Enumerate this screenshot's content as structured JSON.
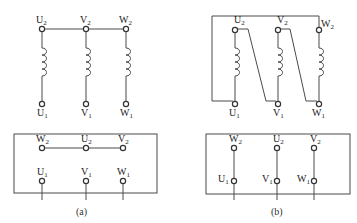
{
  "figure": {
    "panels": [
      {
        "id": "a",
        "caption": "(a)",
        "connection": "star",
        "windings": [
          {
            "top": {
              "base": "U",
              "sub": "2"
            },
            "bottom": {
              "base": "U",
              "sub": "1"
            }
          },
          {
            "top": {
              "base": "V",
              "sub": "2"
            },
            "bottom": {
              "base": "V",
              "sub": "1"
            }
          },
          {
            "top": {
              "base": "W",
              "sub": "2"
            },
            "bottom": {
              "base": "W",
              "sub": "1"
            }
          }
        ],
        "terminal_box": {
          "top_row": [
            {
              "base": "W",
              "sub": "2"
            },
            {
              "base": "U",
              "sub": "2"
            },
            {
              "base": "V",
              "sub": "2"
            }
          ],
          "bottom_row": [
            {
              "base": "U",
              "sub": "1"
            },
            {
              "base": "V",
              "sub": "1"
            },
            {
              "base": "W",
              "sub": "1"
            }
          ]
        }
      },
      {
        "id": "b",
        "caption": "(b)",
        "connection": "delta",
        "windings": [
          {
            "top": {
              "base": "U",
              "sub": "2"
            },
            "bottom": {
              "base": "U",
              "sub": "1"
            }
          },
          {
            "top": {
              "base": "V",
              "sub": "2"
            },
            "bottom": {
              "base": "V",
              "sub": "1"
            }
          },
          {
            "top": {
              "base": "W",
              "sub": "2"
            },
            "bottom": {
              "base": "W",
              "sub": "1"
            }
          }
        ],
        "terminal_box": {
          "top_row": [
            {
              "base": "W",
              "sub": "2"
            },
            {
              "base": "U",
              "sub": "2"
            },
            {
              "base": "V",
              "sub": "2"
            }
          ],
          "bottom_row": [
            {
              "base": "U",
              "sub": "1"
            },
            {
              "base": "V",
              "sub": "1"
            },
            {
              "base": "W",
              "sub": "1"
            }
          ]
        }
      }
    ]
  }
}
